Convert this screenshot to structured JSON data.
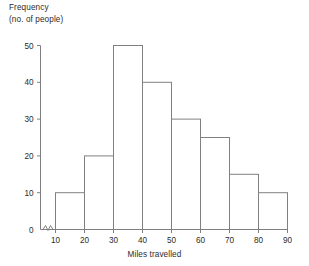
{
  "chart_data": {
    "type": "bar",
    "title": "",
    "subtitle": "",
    "xlabel": "Miles travelled",
    "ylabel": "Frequency\n(no. of people)",
    "ylabel_line1": "Frequency",
    "ylabel_line2": "(no. of people)",
    "categories": [
      "10-20",
      "20-30",
      "30-40",
      "40-50",
      "50-60",
      "60-70",
      "70-80",
      "80-90"
    ],
    "bin_edges": [
      10,
      20,
      30,
      40,
      50,
      60,
      70,
      80,
      90
    ],
    "values": [
      10,
      20,
      50,
      40,
      30,
      25,
      15,
      10
    ],
    "xlim": [
      10,
      90
    ],
    "ylim": [
      0,
      50
    ],
    "x_ticks": [
      10,
      20,
      30,
      40,
      50,
      60,
      70,
      80,
      90
    ],
    "y_ticks": [
      0,
      10,
      20,
      30,
      40,
      50
    ],
    "x_tick_labels": [
      "10",
      "20",
      "30",
      "40",
      "50",
      "60",
      "70",
      "80",
      "90"
    ],
    "y_tick_labels": [
      "0",
      "10",
      "20",
      "30",
      "40",
      "50"
    ],
    "grid": false,
    "legend": "none",
    "bar_fill": "#ffffff",
    "bar_stroke": "#808080",
    "axis_color": "#808080",
    "text_color": "#2b2b2b",
    "axis_break": "zigzag-x-origin",
    "annotations": []
  }
}
